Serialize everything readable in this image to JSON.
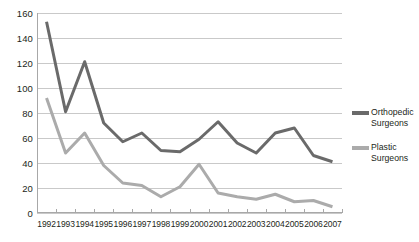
{
  "chart_data": {
    "type": "line",
    "title": "",
    "xlabel": "",
    "ylabel": "",
    "grid": true,
    "legend_position": "right",
    "ylim": [
      0,
      160
    ],
    "ytick_step": 20,
    "yticks": [
      "0",
      "20",
      "40",
      "60",
      "80",
      "100",
      "120",
      "140",
      "160"
    ],
    "categories": [
      "1992",
      "1993",
      "1994",
      "1995",
      "1996",
      "1997",
      "1998",
      "1999",
      "2000",
      "2001",
      "2002",
      "2003",
      "2004",
      "2005",
      "2006",
      "2007"
    ],
    "series": [
      {
        "name": "Orthopedic Surgeons",
        "legend_line1": "Orthopedic",
        "legend_line2": "Surgeons",
        "color": "#6a6a6a",
        "values": [
          153,
          81,
          121,
          72,
          57,
          64,
          50,
          49,
          59,
          73,
          56,
          48,
          64,
          68,
          46,
          41
        ]
      },
      {
        "name": "Plastic Surgeons",
        "legend_line1": "Plastic",
        "legend_line2": "Surgeons",
        "color": "#ababab",
        "values": [
          92,
          48,
          64,
          38,
          24,
          22,
          13,
          21,
          39,
          16,
          13,
          11,
          15,
          9,
          10,
          5
        ]
      }
    ]
  },
  "axes": {
    "grid_color": "#c9c9c9",
    "axis_color": "#a8a8a8",
    "text_color": "#231f20"
  }
}
